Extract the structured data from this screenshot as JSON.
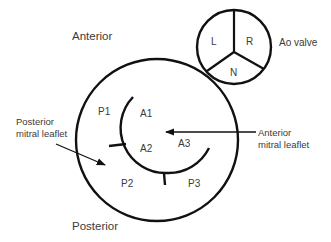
{
  "diagram": {
    "orientation_labels": {
      "top": "Anterior",
      "bottom": "Posterior"
    },
    "aortic_valve": {
      "label": "Ao valve",
      "cusps": [
        "L",
        "R",
        "N"
      ]
    },
    "anterior_leaflet": {
      "label_line1": "Anterior",
      "label_line2": "mitral leaflet",
      "scallops": [
        "A1",
        "A2",
        "A3"
      ]
    },
    "posterior_leaflet": {
      "label_line1": "Posterior",
      "label_line2": "mitral leaflet",
      "scallops": [
        "P1",
        "P2",
        "P3"
      ]
    },
    "colors": {
      "line": "#111111",
      "text": "#3a3a3a",
      "background": "#ffffff"
    }
  }
}
